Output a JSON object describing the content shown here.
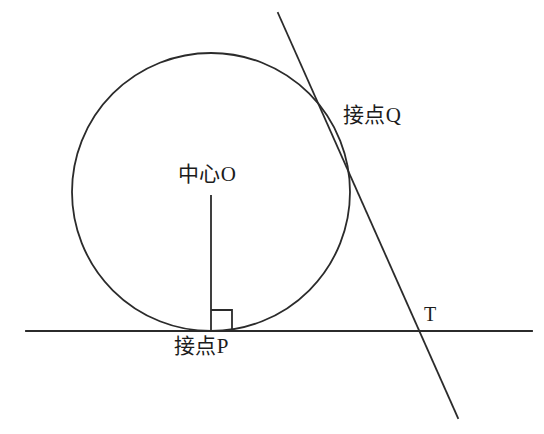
{
  "figure": {
    "background_color": "#ffffff",
    "stroke_color": "#2b2b2b",
    "canvas": {
      "width": 544,
      "height": 434
    }
  },
  "labels": {
    "center": "中心O",
    "tangent_point_q": "接点Q",
    "tangent_point_p": "接点P",
    "point_t": "T"
  },
  "geometry": {
    "circle": {
      "cx": 211,
      "cy": 192,
      "r": 139
    },
    "horizontal_line": {
      "x1": 26,
      "y1": 331,
      "x2": 532,
      "y2": 331
    },
    "slanted_tangent_line": {
      "x1": 278,
      "y1": 13,
      "x2": 458,
      "y2": 418
    },
    "radius_segment": {
      "x1": 211,
      "y1": 196,
      "x2": 211,
      "y2": 331
    },
    "right_angle_marker": {
      "x": 211,
      "y": 310,
      "size": 21
    },
    "tangent_point_q_coords": {
      "x": 332,
      "y": 134
    },
    "tangent_point_p_coords": {
      "x": 211,
      "y": 331
    },
    "point_t_coords": {
      "x": 423,
      "y": 331
    }
  }
}
